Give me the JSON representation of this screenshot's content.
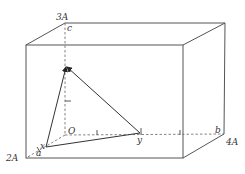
{
  "diagram": {
    "type": "3d-coordinate-box",
    "axis_labels": {
      "origin": "O",
      "x_axis_end": "a",
      "y_axis_end": "b",
      "z_axis_end": "c"
    },
    "axis_extents": {
      "x": "2A",
      "y": "4A",
      "z": "3A"
    },
    "points": {
      "x": "x",
      "y": "y",
      "z": "z"
    },
    "tick_marks": "1"
  }
}
